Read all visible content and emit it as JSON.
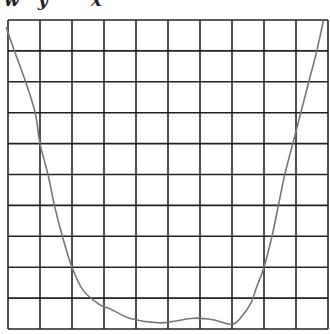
{
  "caption": {
    "text": "w y   x",
    "note": "partially clipped at top edge"
  },
  "chart_data": {
    "type": "line",
    "title": "",
    "xlabel": "",
    "ylabel": "",
    "grid": {
      "columns": 10,
      "rows": 10,
      "visible": true
    },
    "axis_ticks": "none shown",
    "series": [
      {
        "name": "curve",
        "points_grid_units": [
          [
            -0.05,
            9.75
          ],
          [
            0.2,
            9.0
          ],
          [
            0.55,
            8.0
          ],
          [
            0.85,
            7.0
          ],
          [
            1.0,
            6.0
          ],
          [
            1.25,
            5.0
          ],
          [
            1.45,
            4.0
          ],
          [
            1.7,
            3.0
          ],
          [
            2.0,
            2.0
          ],
          [
            2.35,
            1.25
          ],
          [
            2.85,
            0.8
          ],
          [
            3.2,
            0.65
          ],
          [
            3.8,
            0.35
          ],
          [
            4.7,
            0.2
          ],
          [
            5.2,
            0.25
          ],
          [
            5.8,
            0.35
          ],
          [
            6.4,
            0.3
          ],
          [
            7.0,
            0.15
          ],
          [
            7.3,
            0.4
          ],
          [
            7.6,
            0.85
          ],
          [
            7.75,
            1.3
          ],
          [
            8.0,
            2.0
          ],
          [
            8.25,
            3.0
          ],
          [
            8.45,
            4.0
          ],
          [
            8.65,
            5.0
          ],
          [
            8.9,
            6.0
          ],
          [
            9.15,
            7.0
          ],
          [
            9.4,
            8.0
          ],
          [
            9.65,
            9.0
          ],
          [
            9.85,
            9.95
          ]
        ]
      }
    ],
    "xlim": [
      0,
      10
    ],
    "ylim": [
      0,
      10
    ]
  },
  "colors": {
    "grid": "#222222",
    "curve": "#777777",
    "background": "#ffffff"
  },
  "layout": {
    "left": 8,
    "top": 20,
    "right": 328,
    "bottom": 329
  }
}
